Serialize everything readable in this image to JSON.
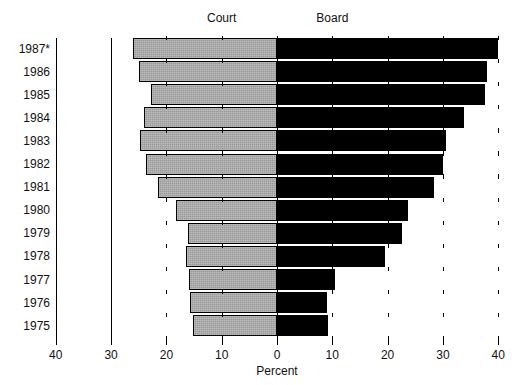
{
  "chart_data": {
    "type": "bar",
    "orientation": "horizontal-diverging",
    "title": "",
    "xlabel": "Percent",
    "ylabel": "",
    "categories": [
      "1987*",
      "1986",
      "1985",
      "1984",
      "1983",
      "1982",
      "1981",
      "1980",
      "1979",
      "1978",
      "1977",
      "1976",
      "1975"
    ],
    "series": [
      {
        "name": "Court",
        "direction": "left",
        "color": "#9a9a9a",
        "values": [
          26.0,
          25.0,
          22.7,
          24.0,
          24.7,
          23.7,
          21.5,
          18.3,
          16.1,
          16.5,
          15.9,
          15.7,
          15.2
        ]
      },
      {
        "name": "Board",
        "direction": "right",
        "color": "#000000",
        "values": [
          40.0,
          38.0,
          37.6,
          33.8,
          30.5,
          30.0,
          28.4,
          23.6,
          22.6,
          19.5,
          10.5,
          9.0,
          9.2
        ]
      }
    ],
    "xlim": [
      -40,
      40
    ],
    "x_ticks": [
      {
        "value": -40,
        "label": "40"
      },
      {
        "value": -30,
        "label": "30"
      },
      {
        "value": -20,
        "label": "20"
      },
      {
        "value": -10,
        "label": "10"
      },
      {
        "value": 0,
        "label": "0"
      },
      {
        "value": 10,
        "label": "10"
      },
      {
        "value": 20,
        "label": "20"
      },
      {
        "value": 30,
        "label": "30"
      },
      {
        "value": 40,
        "label": "40"
      }
    ],
    "grid": false,
    "legend_position": "top-inline",
    "legend": [
      {
        "label": "Court",
        "at_value": -10
      },
      {
        "label": "Board",
        "at_value": 10
      }
    ]
  },
  "axis": {
    "x_title": "Percent"
  }
}
